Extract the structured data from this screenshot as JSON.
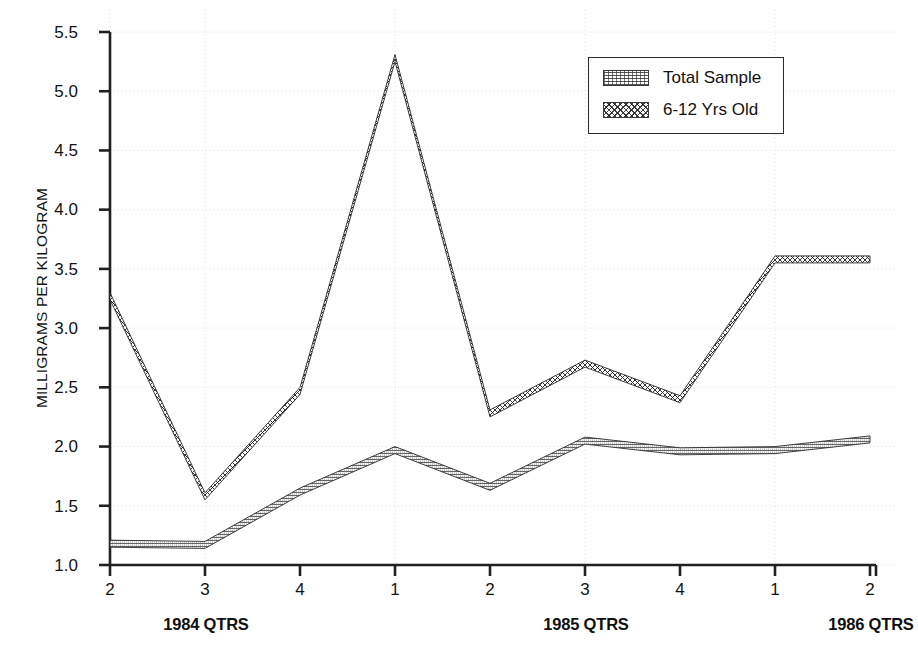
{
  "chart_data": {
    "type": "line",
    "title": "",
    "xlabel": "",
    "ylabel": "MILLIGRAMS PER KILOGRAM",
    "ylim": [
      1.0,
      5.5
    ],
    "ytick_labels": [
      "5.5",
      "5.0",
      "4.5",
      "4.0",
      "3.5",
      "3.0",
      "2.5",
      "2.0",
      "1.5",
      "1.0"
    ],
    "ytick_values": [
      5.5,
      5.0,
      4.5,
      4.0,
      3.5,
      3.0,
      2.5,
      2.0,
      1.5,
      1.0
    ],
    "categories": [
      "2",
      "3",
      "4",
      "1",
      "2",
      "3",
      "4",
      "1",
      "2"
    ],
    "x_group_labels": [
      "1984 QTRS",
      "1985 QTRS",
      "1986 QTRS"
    ],
    "grid": true,
    "legend_position": "top-right",
    "series": [
      {
        "name": "Total Sample",
        "pattern": "fine-speckle-hatch",
        "values": [
          1.18,
          1.17,
          1.62,
          1.97,
          1.66,
          2.05,
          1.96,
          1.97,
          2.06
        ]
      },
      {
        "name": "6-12 Yrs Old",
        "pattern": "cross-hatch",
        "values": [
          3.27,
          1.58,
          2.47,
          5.28,
          2.28,
          2.7,
          2.4,
          3.58,
          3.58
        ]
      }
    ]
  },
  "legend": {
    "items": [
      {
        "label": "Total Sample"
      },
      {
        "label": "6-12 Yrs Old"
      }
    ]
  },
  "axis": {
    "y_title": "MILLIGRAMS PER KILOGRAM",
    "y_ticks": [
      "5.5",
      "5.0",
      "4.5",
      "4.0",
      "3.5",
      "3.0",
      "2.5",
      "2.0",
      "1.5",
      "1.0"
    ],
    "x_ticks": [
      "2",
      "3",
      "4",
      "1",
      "2",
      "3",
      "4",
      "1",
      "2"
    ],
    "x_groups": [
      "1984 QTRS",
      "1985 QTRS",
      "1986 QTRS"
    ]
  },
  "colors": {
    "axis": "#202020",
    "grid": "#e2e2e2",
    "ink": "#121212",
    "background": "#ffffff"
  },
  "caption": {
    "text": ""
  }
}
